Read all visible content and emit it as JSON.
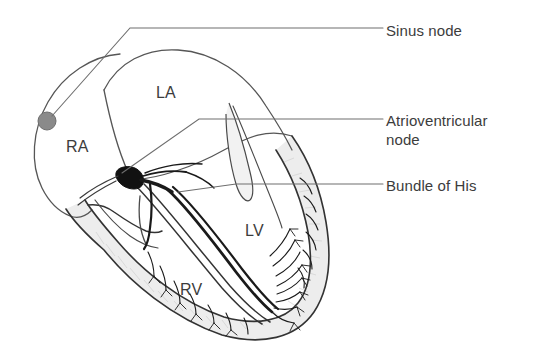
{
  "figure": {
    "background_color": "#ffffff",
    "line_color": "#3c3c3c",
    "text_color": "#3c3c3c",
    "myocardium_fill": "#ededed",
    "sinus_node_color": "#8a8a8a",
    "av_node_color": "#111111"
  },
  "callouts": [
    {
      "id": "sinus-node",
      "label": "Sinus node"
    },
    {
      "id": "atrioventricular-node",
      "label": "Atrioventricular\nnode"
    },
    {
      "id": "bundle-of-his",
      "label": "Bundle of His"
    }
  ],
  "chambers": [
    {
      "id": "right-atrium",
      "abbr": "RA"
    },
    {
      "id": "left-atrium",
      "abbr": "LA"
    },
    {
      "id": "right-ventricle",
      "abbr": "RV"
    },
    {
      "id": "left-ventricle",
      "abbr": "LV"
    }
  ],
  "structures": {
    "sinus_node_marker": "filled-gray-circle",
    "av_node_marker": "filled-black-teardrop",
    "conduction_pathway": "bundle-of-his-with-left-and-right-bundle-branches",
    "terminal_network": "purkinje-fibers",
    "valves": "mitral-and-tricuspid-leaflets"
  }
}
